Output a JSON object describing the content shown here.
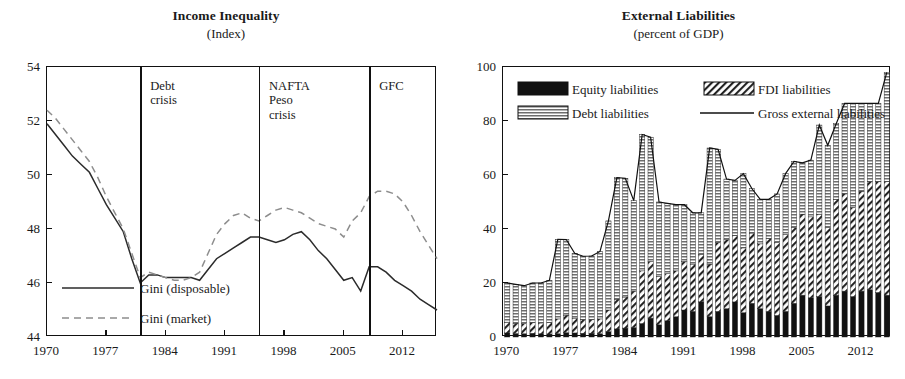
{
  "left": {
    "title": "Income Inequality",
    "subtitle": "(Index)",
    "yticks": [
      "44",
      "46",
      "48",
      "50",
      "52",
      "54"
    ],
    "xticks": [
      "1970",
      "1977",
      "1984",
      "1991",
      "1998",
      "2005",
      "2012"
    ],
    "events": [
      {
        "name": "debt-crisis",
        "label": "Debt\ncrisis",
        "year": 1981
      },
      {
        "name": "nafta-peso-crisis",
        "label": "NAFTA\nPeso\ncrisis",
        "year": 1995
      },
      {
        "name": "gfc",
        "label": "GFC",
        "year": 2008
      }
    ],
    "legend": [
      {
        "name": "gini-disposable",
        "label": "Gini (disposable)",
        "style": "solid",
        "color": "#2b2b2b"
      },
      {
        "name": "gini-market",
        "label": "Gini (market)",
        "style": "dashed",
        "color": "#8d8d8d"
      }
    ]
  },
  "right": {
    "title": "External Liabilities",
    "subtitle": "(percent of GDP)",
    "yticks": [
      "0",
      "20",
      "40",
      "60",
      "80",
      "100"
    ],
    "xticks": [
      "1970",
      "1977",
      "1984",
      "1991",
      "1998",
      "2005",
      "2012"
    ],
    "legend": [
      {
        "name": "equity-liabilities",
        "label": "Equity liabilities",
        "swatch": "solid-black"
      },
      {
        "name": "fdi-liabilities",
        "label": "FDI liabilities",
        "swatch": "diagonal-hatch"
      },
      {
        "name": "debt-liabilities",
        "label": "Debt liabilities",
        "swatch": "gray-fill"
      },
      {
        "name": "gross-external-liabilities",
        "label": "Gross external liabilities",
        "swatch": "line"
      }
    ]
  },
  "chart_data": [
    {
      "type": "line",
      "title": "Income Inequality",
      "subtitle": "(Index)",
      "xlabel": "",
      "ylabel": "Index",
      "xlim": [
        1970,
        2016
      ],
      "ylim": [
        44,
        54
      ],
      "yticks": [
        44,
        46,
        48,
        50,
        52,
        54
      ],
      "xticks": [
        1970,
        1977,
        1984,
        1991,
        1998,
        2005,
        2012
      ],
      "grid": false,
      "legend_position": "bottom-left",
      "annotations": [
        {
          "label": "Debt crisis",
          "x": 1981
        },
        {
          "label": "NAFTA Peso crisis",
          "x": 1995
        },
        {
          "label": "GFC",
          "x": 2008
        }
      ],
      "x": [
        1970,
        1971,
        1972,
        1973,
        1974,
        1975,
        1976,
        1977,
        1978,
        1979,
        1980,
        1981,
        1982,
        1983,
        1984,
        1985,
        1986,
        1987,
        1988,
        1989,
        1990,
        1991,
        1992,
        1993,
        1994,
        1995,
        1996,
        1997,
        1998,
        1999,
        2000,
        2001,
        2002,
        2003,
        2004,
        2005,
        2006,
        2007,
        2008,
        2009,
        2010,
        2011,
        2012,
        2013,
        2014,
        2015,
        2016
      ],
      "series": [
        {
          "name": "Gini (disposable)",
          "style": "solid",
          "values": [
            51.9,
            51.5,
            51.1,
            50.7,
            50.4,
            50.1,
            49.5,
            48.9,
            48.4,
            47.9,
            46.9,
            46.0,
            46.3,
            46.3,
            46.2,
            46.2,
            46.2,
            46.2,
            46.1,
            46.5,
            46.9,
            47.1,
            47.3,
            47.5,
            47.7,
            47.7,
            47.6,
            47.5,
            47.6,
            47.8,
            47.9,
            47.6,
            47.2,
            46.9,
            46.5,
            46.1,
            46.2,
            45.7,
            46.6,
            46.6,
            46.4,
            46.1,
            45.9,
            45.7,
            45.4,
            45.2,
            45.0
          ]
        },
        {
          "name": "Gini (market)",
          "style": "dashed",
          "values": [
            52.4,
            52.1,
            51.7,
            51.3,
            50.9,
            50.5,
            49.9,
            49.2,
            48.6,
            48.0,
            47.1,
            46.2,
            46.4,
            46.3,
            46.2,
            46.1,
            46.1,
            46.2,
            46.4,
            47.1,
            47.8,
            48.2,
            48.5,
            48.6,
            48.4,
            48.3,
            48.5,
            48.7,
            48.8,
            48.7,
            48.6,
            48.4,
            48.2,
            48.1,
            48.0,
            47.7,
            48.3,
            48.6,
            49.2,
            49.4,
            49.4,
            49.3,
            49.0,
            48.5,
            47.9,
            47.4,
            46.9
          ]
        }
      ]
    },
    {
      "type": "bar",
      "stacked": true,
      "title": "External Liabilities",
      "subtitle": "(percent of GDP)",
      "xlabel": "",
      "ylabel": "percent of GDP",
      "ylim": [
        0,
        100
      ],
      "yticks": [
        0,
        20,
        40,
        60,
        80,
        100
      ],
      "xticks": [
        1970,
        1977,
        1984,
        1991,
        1998,
        2005,
        2012
      ],
      "grid": false,
      "legend_position": "top-left",
      "categories": [
        1970,
        1971,
        1972,
        1973,
        1974,
        1975,
        1976,
        1977,
        1978,
        1979,
        1980,
        1981,
        1982,
        1983,
        1984,
        1985,
        1986,
        1987,
        1988,
        1989,
        1990,
        1991,
        1992,
        1993,
        1994,
        1995,
        1996,
        1997,
        1998,
        1999,
        2000,
        2001,
        2002,
        2003,
        2004,
        2005,
        2006,
        2007,
        2008,
        2009,
        2010,
        2011,
        2012,
        2013,
        2014,
        2015
      ],
      "series": [
        {
          "name": "Equity liabilities",
          "fill": "solid-black",
          "values": [
            1.5,
            1.3,
            1.2,
            1.4,
            1.2,
            1.1,
            1.2,
            1.6,
            1.5,
            1.4,
            1.4,
            1.2,
            2.0,
            3.0,
            3.3,
            3.5,
            5.0,
            7.0,
            4.5,
            6.0,
            7.5,
            10.0,
            9.5,
            13.0,
            7.5,
            9.5,
            10.5,
            13.0,
            9.0,
            12.5,
            10.5,
            9.5,
            8.0,
            9.5,
            12.5,
            15.5,
            14.5,
            15.0,
            11.5,
            15.5,
            17.0,
            15.0,
            17.0,
            17.5,
            16.5,
            15.5
          ]
        },
        {
          "name": "FDI liabilities",
          "fill": "diagonal-hatch",
          "values": [
            4.0,
            3.8,
            3.7,
            3.9,
            4.0,
            4.2,
            5.5,
            6.5,
            5.5,
            5.0,
            5.0,
            5.5,
            8.0,
            11.0,
            11.5,
            13.5,
            19.5,
            21.0,
            18.0,
            17.5,
            17.0,
            18.0,
            17.5,
            17.5,
            19.5,
            25.5,
            25.5,
            24.5,
            24.0,
            26.0,
            24.0,
            27.0,
            27.0,
            28.5,
            28.0,
            30.0,
            30.0,
            30.5,
            29.0,
            35.5,
            36.0,
            33.0,
            37.0,
            40.0,
            41.0,
            42.0
          ]
        },
        {
          "name": "Debt liabilities",
          "fill": "gray-fill",
          "values": [
            14.5,
            14.4,
            14.1,
            14.7,
            14.8,
            15.7,
            29.5,
            28.0,
            24.0,
            23.5,
            23.6,
            25.0,
            33.0,
            45.0,
            44.0,
            33.5,
            50.5,
            46.0,
            27.5,
            26.0,
            24.5,
            21.0,
            19.0,
            15.5,
            43.0,
            34.5,
            22.5,
            20.5,
            27.5,
            16.5,
            16.5,
            14.5,
            18.0,
            22.5,
            24.5,
            19.0,
            21.0,
            33.0,
            30.5,
            28.0,
            33.5,
            38.5,
            32.5,
            29.0,
            29.0,
            40.5
          ]
        }
      ],
      "total_line": {
        "name": "Gross external liabilities",
        "values": [
          20.0,
          19.5,
          19.0,
          20.0,
          20.0,
          21.0,
          36.2,
          36.1,
          31.0,
          29.9,
          30.0,
          31.7,
          43.0,
          59.0,
          58.8,
          50.5,
          75.0,
          74.0,
          50.0,
          49.5,
          49.0,
          49.0,
          46.0,
          46.0,
          70.0,
          69.5,
          58.5,
          58.0,
          60.5,
          55.0,
          51.0,
          51.0,
          53.0,
          60.5,
          65.0,
          64.5,
          65.5,
          78.5,
          71.0,
          79.0,
          86.5,
          86.5,
          86.5,
          86.5,
          86.5,
          98.0
        ]
      }
    }
  ]
}
